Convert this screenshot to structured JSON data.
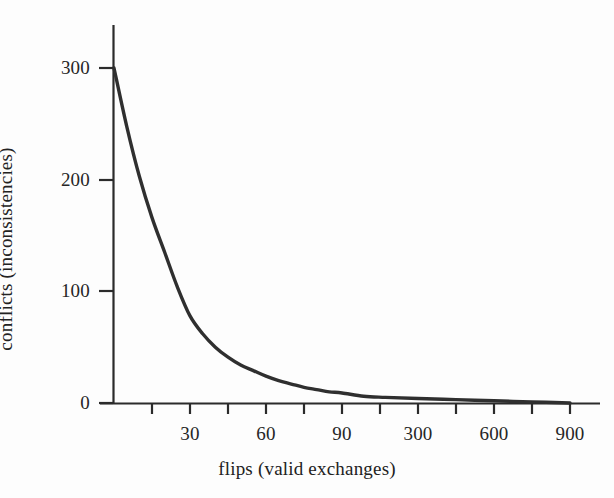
{
  "figure": {
    "background_color": "#fdfdfd",
    "ink_color": "#2b2b2b"
  },
  "chart_data": {
    "type": "line",
    "title": "",
    "xlabel": "flips (valid exchanges)",
    "ylabel": "conflicts (inconsistencies)",
    "grid": false,
    "legend": false,
    "line_color": "#2f2f2f",
    "x_axis": {
      "label": "flips (valid exchanges)",
      "tick_count": 12,
      "tick_labels": [
        "",
        "30",
        "",
        "60",
        "",
        "90",
        "",
        "300",
        "",
        "600",
        "",
        "900"
      ],
      "labeled_ticks": [
        {
          "index": 2,
          "label": "30"
        },
        {
          "index": 4,
          "label": "60"
        },
        {
          "index": 6,
          "label": "90"
        },
        {
          "index": 8,
          "label": "300"
        },
        {
          "index": 10,
          "label": "600"
        },
        {
          "index": 12,
          "label": "900"
        }
      ],
      "scale_note": "non-uniform: equal pixel spacing for 30,60,90 then 300,600,900"
    },
    "y_axis": {
      "label": "conflicts (inconsistencies)",
      "tick_labels": [
        "0",
        "100",
        "200",
        "300"
      ],
      "ylim": [
        0,
        300
      ],
      "ticks": [
        0,
        100,
        200,
        300
      ]
    },
    "series": [
      {
        "name": "conflicts",
        "x": [
          0,
          5,
          10,
          15,
          20,
          25,
          30,
          35,
          40,
          45,
          50,
          55,
          60,
          65,
          70,
          75,
          80,
          85,
          90,
          150,
          210,
          300,
          450,
          600,
          750,
          900
        ],
        "values": [
          300,
          248,
          203,
          166,
          135,
          104,
          78,
          62,
          50,
          41,
          34,
          29,
          24,
          20,
          17,
          14,
          12,
          10,
          9,
          6,
          5,
          4,
          3,
          2,
          1,
          0
        ]
      }
    ]
  }
}
